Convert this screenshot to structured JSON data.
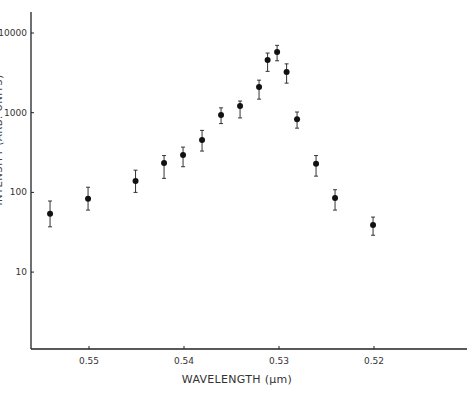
{
  "chart_data": {
    "type": "scatter",
    "title": "",
    "xlabel": "WAVELENGTH (μm)",
    "ylabel": "INTENSITY (ARB. UNITS)",
    "x_scale": "linear",
    "x_reversed": true,
    "xlim": [
      0.5563,
      0.5106
    ],
    "x_ticks": [
      0.55,
      0.54,
      0.53,
      0.52
    ],
    "x_tick_labels": [
      "0.55",
      "0.54",
      "0.53",
      "0.52"
    ],
    "y_scale": "log",
    "ylim": [
      1.5,
      14000
    ],
    "y_ticks": [
      10,
      100,
      1000,
      10000
    ],
    "y_tick_labels": [
      "10",
      "100",
      "1000",
      "10000"
    ],
    "grid": false,
    "legend": "none",
    "series": [
      {
        "name": "intensity",
        "marker": "filled-circle",
        "error_bars": true,
        "points": [
          {
            "x": 0.5541,
            "y": 54,
            "lo": 37,
            "hi": 78
          },
          {
            "x": 0.5501,
            "y": 83,
            "lo": 60,
            "hi": 116
          },
          {
            "x": 0.5451,
            "y": 139,
            "lo": 100,
            "hi": 190
          },
          {
            "x": 0.5421,
            "y": 233,
            "lo": 150,
            "hi": 290
          },
          {
            "x": 0.5401,
            "y": 294,
            "lo": 210,
            "hi": 370
          },
          {
            "x": 0.5381,
            "y": 455,
            "lo": 330,
            "hi": 600
          },
          {
            "x": 0.5361,
            "y": 935,
            "lo": 730,
            "hi": 1150
          },
          {
            "x": 0.5341,
            "y": 1210,
            "lo": 860,
            "hi": 1400
          },
          {
            "x": 0.5321,
            "y": 2100,
            "lo": 1480,
            "hi": 2560
          },
          {
            "x": 0.5312,
            "y": 4580,
            "lo": 3300,
            "hi": 5600
          },
          {
            "x": 0.5302,
            "y": 5770,
            "lo": 4480,
            "hi": 7000
          },
          {
            "x": 0.5292,
            "y": 3240,
            "lo": 2350,
            "hi": 4100
          },
          {
            "x": 0.5281,
            "y": 830,
            "lo": 640,
            "hi": 1020
          },
          {
            "x": 0.5261,
            "y": 228,
            "lo": 160,
            "hi": 290
          },
          {
            "x": 0.5241,
            "y": 85,
            "lo": 60,
            "hi": 108
          },
          {
            "x": 0.5201,
            "y": 39,
            "lo": 29,
            "hi": 49
          }
        ]
      }
    ]
  }
}
